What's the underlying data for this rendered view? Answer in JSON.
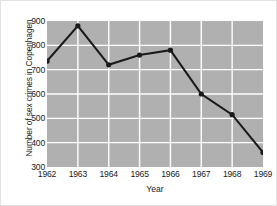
{
  "chart_data": {
    "type": "line",
    "title": "",
    "xlabel": "Year",
    "ylabel": "Number of sex crimes in Copenhagen",
    "categories": [
      "1962",
      "1963",
      "1964",
      "1965",
      "1966",
      "1967",
      "1968",
      "1969"
    ],
    "x": [
      1962,
      1963,
      1964,
      1965,
      1966,
      1967,
      1968,
      1969
    ],
    "values": [
      735,
      880,
      720,
      760,
      780,
      600,
      515,
      360
    ],
    "series": [
      {
        "name": "Sex crimes",
        "values": [
          735,
          880,
          720,
          760,
          780,
          600,
          515,
          360
        ]
      }
    ],
    "ylim": [
      300,
      900
    ],
    "xlim": [
      1962,
      1969
    ],
    "yticks": [
      900,
      800,
      700,
      600,
      500,
      400,
      300
    ],
    "ytick_labels": [
      "900",
      "800",
      "700",
      "600",
      "500",
      "400",
      "300"
    ],
    "xtick_labels": [
      "1962",
      "1963",
      "1964",
      "1965",
      "1966",
      "1967",
      "1968",
      "1969"
    ],
    "grid": true,
    "grid_color": "#ffffff",
    "plot_background": "#b0b0b0",
    "line_color": "#1a1a1a",
    "marker": "circle",
    "marker_color": "#1a1a1a",
    "legend": null,
    "legend_position": "none",
    "figure_background": "#ffffff"
  }
}
